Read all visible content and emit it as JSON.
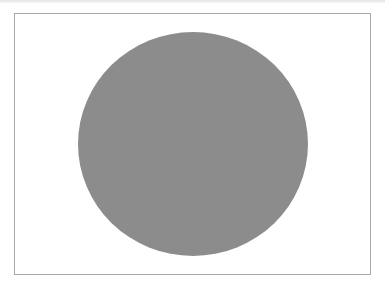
{
  "canvas": {
    "width": 385,
    "height": 286,
    "background": "#ffffff"
  },
  "frame": {
    "border_color": "#a8a8a8",
    "left": 14,
    "top": 13,
    "right": 371,
    "bottom": 275
  },
  "shape": {
    "type": "ellipse",
    "fill": "#8c8c8c",
    "center_x": 193,
    "center_y": 144,
    "radius_x": 115,
    "radius_y": 112
  }
}
